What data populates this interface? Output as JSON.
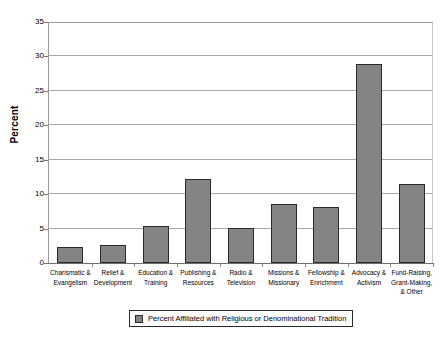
{
  "chart_data": {
    "type": "bar",
    "title": "",
    "xlabel": "",
    "ylabel": "Percent",
    "ylim": [
      0,
      35
    ],
    "yticks": [
      0,
      5,
      10,
      15,
      20,
      25,
      30,
      35
    ],
    "grid": true,
    "legend_position": "bottom",
    "categories": [
      "Charismatic & Evangelism",
      "Relief & Development",
      "Education & Training",
      "Publishing & Resources",
      "Radio & Television",
      "Missions & Missionary",
      "Fellowship & Enrichment",
      "Advocacy & Activism",
      "Fund-Raising, Grant-Making, & Other"
    ],
    "category_lines": [
      [
        "Charismatic &",
        "Evangelism"
      ],
      [
        "Relief &",
        "Development"
      ],
      [
        "Education &",
        "Training"
      ],
      [
        "Publishing &",
        "Resources"
      ],
      [
        "Radio &",
        "Television"
      ],
      [
        "Missions &",
        "Missionary"
      ],
      [
        "Fellowship &",
        "Enrichment"
      ],
      [
        "Advocacy &",
        "Activism"
      ],
      [
        "Fund-Raising,",
        "Grant-Making,",
        "& Other"
      ]
    ],
    "series": [
      {
        "name": "Percent Affiliated with Religious or Denominational Tradition",
        "values": [
          2.3,
          2.6,
          5.4,
          12.2,
          5.1,
          8.6,
          8.1,
          28.9,
          11.5
        ]
      }
    ],
    "colors": {
      "bar_fill": "#848484",
      "bar_border": "#2b2b2b",
      "gridline": "#a8a8a8",
      "axis": "#6f6f6f",
      "background": "#ffffff"
    }
  },
  "axis": {
    "y_title": "Percent",
    "y_tick_labels": [
      "35",
      "30",
      "25",
      "20",
      "15",
      "10",
      "5",
      "0"
    ]
  },
  "legend": {
    "entries": [
      {
        "label": "Percent Affiliated with Religious or Denominational Tradition",
        "swatch": "#848484"
      }
    ]
  }
}
